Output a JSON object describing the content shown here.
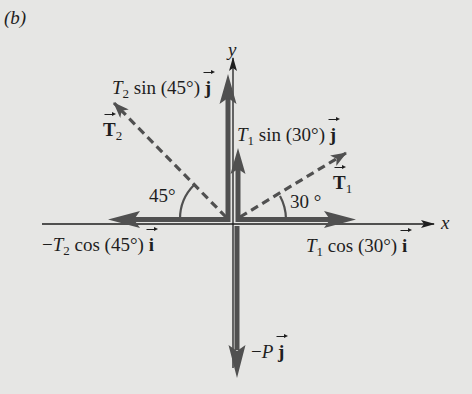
{
  "figure": {
    "panel_label": "(b)",
    "colors": {
      "background": "#e6e6e4",
      "thick_arrow": "#505050",
      "thin_axis": "#1e1e1e",
      "dashed": "#505050",
      "text": "#1e1e1e"
    }
  },
  "axes": {
    "x_label": "x",
    "y_label": "y"
  },
  "vectors": {
    "T2": {
      "symbol": "T",
      "subscript": "2",
      "style": "dashed",
      "angle_deg": 45,
      "direction": "upper-left"
    },
    "T1": {
      "symbol": "T",
      "subscript": "1",
      "style": "dashed",
      "angle_deg": 30,
      "direction": "upper-right"
    }
  },
  "components": {
    "t2_sin": {
      "prefix": "T",
      "sub": "2",
      "text": " sin (45°) ",
      "unit": "j"
    },
    "t1_sin": {
      "prefix": "T",
      "sub": "1",
      "text": " sin (30°) ",
      "unit": "j"
    },
    "t2_cos": {
      "sign": "−",
      "prefix": "T",
      "sub": "2",
      "text": " cos (45°) ",
      "unit": "i"
    },
    "t1_cos": {
      "prefix": "T",
      "sub": "1",
      "text": " cos (30°) ",
      "unit": "i"
    },
    "weight": {
      "sign": "−",
      "prefix": "P",
      "text": " ",
      "unit": "j"
    }
  },
  "angles": {
    "left": "45°",
    "right": "30 °"
  }
}
